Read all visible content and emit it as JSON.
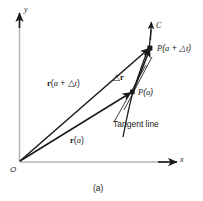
{
  "figure": {
    "caption": "(a)",
    "axes": {
      "x_label": "x",
      "y_label": "y",
      "origin_label": "O",
      "axis_color": "#b5b5b5"
    },
    "curve": {
      "name": "C",
      "label": "C",
      "color": "#1a1a1a"
    },
    "points": [
      {
        "name": "point-p-a-plus-delta-t",
        "label": "P(a + △t)",
        "x": 150,
        "y": 48
      },
      {
        "name": "point-p-a",
        "label": "P(a)",
        "x": 132,
        "y": 92
      }
    ],
    "vectors": [
      {
        "name": "vector-r-a-plus-delta-t",
        "label": "r(a + △t)"
      },
      {
        "name": "vector-r-a",
        "label": "r(a)"
      },
      {
        "name": "vector-delta-r",
        "label": "△r"
      }
    ],
    "annotations": [
      {
        "name": "tangent-line-label",
        "label": "Tangent line"
      }
    ],
    "label_parts": {
      "P_italic": "P",
      "paren_open": "(",
      "a_italic": "a",
      "plus": " + ",
      "delta": "△",
      "t_italic": "t",
      "paren_close": ")",
      "r_bold": "r",
      "tangent_text": "Tangent line"
    }
  }
}
